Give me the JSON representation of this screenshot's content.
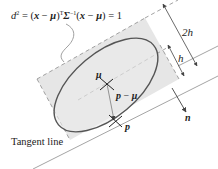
{
  "diagram": {
    "equation": {
      "d": "d",
      "sq": "2",
      "eq1": " = (",
      "x1": "x",
      "minus1": " − ",
      "mu1": "μ",
      "close1": ")",
      "T": "T",
      "Sigma": "Σ",
      "inv": "−1",
      "open2": "(",
      "x2": "x",
      "minus2": " − ",
      "mu2": "μ",
      "close2": ") = 1"
    },
    "labels": {
      "two_h": "2h",
      "h": "h",
      "mu": "μ",
      "p_minus_mu_p": "p",
      "p_minus_mu_minus": " − ",
      "p_minus_mu_mu": "μ",
      "p": "p",
      "n": "n",
      "tangent_line": "Tangent line"
    },
    "colors": {
      "region_fill": "#e6e6e6",
      "ellipse_stroke": "#555555",
      "line_stroke": "#8a8a8a",
      "dash_stroke": "#8a8a8a",
      "arrow": "#555555"
    }
  }
}
